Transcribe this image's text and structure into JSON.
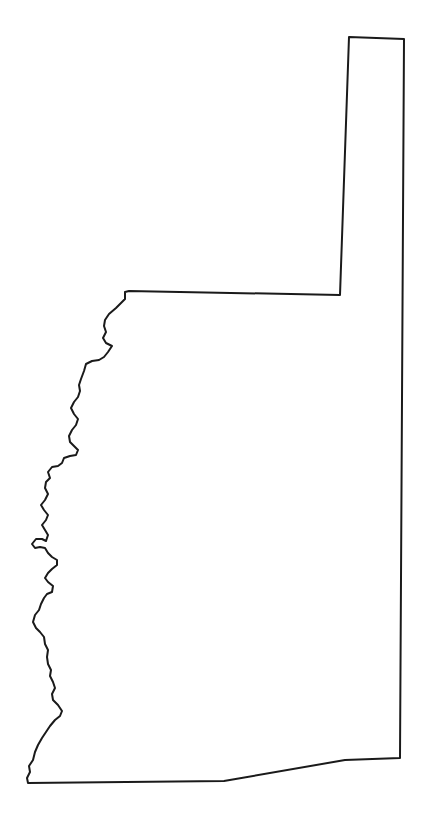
{
  "map": {
    "type": "region-outline",
    "stroke_color": "#1a1a1a",
    "fill_color": "#ffffff",
    "background": "#ffffff",
    "labels": []
  }
}
